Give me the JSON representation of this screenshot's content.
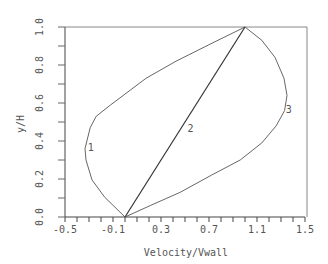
{
  "chart_data": {
    "type": "line",
    "title": "",
    "xlabel": "Velocity/Vwall",
    "ylabel": "y/H",
    "xlim": [
      -0.5,
      1.5
    ],
    "ylim": [
      0.0,
      1.0
    ],
    "x_ticks": [
      "-0.5",
      "-0.1",
      "0.3",
      "0.7",
      "1.1",
      "1.5"
    ],
    "y_ticks": [
      "0.0",
      "0.2",
      "0.4",
      "0.6",
      "0.8",
      "1.0"
    ],
    "grid": false,
    "legend": "none (curves labeled inline 1, 2, 3)",
    "series": [
      {
        "name": "1",
        "label_pos": [
          -0.31,
          0.37
        ],
        "points": [
          [
            0.0,
            0.0
          ],
          [
            -0.17,
            0.105
          ],
          [
            -0.275,
            0.195
          ],
          [
            -0.325,
            0.3
          ],
          [
            -0.333,
            0.36
          ],
          [
            -0.29,
            0.47
          ],
          [
            -0.24,
            0.53
          ],
          [
            -0.12,
            0.59
          ],
          [
            0.175,
            0.73
          ],
          [
            0.425,
            0.82
          ],
          [
            0.71,
            0.91
          ],
          [
            1.0,
            1.0
          ]
        ]
      },
      {
        "name": "2",
        "label_pos": [
          0.52,
          0.47
        ],
        "points": [
          [
            0.0,
            0.0
          ],
          [
            1.0,
            1.0
          ]
        ]
      },
      {
        "name": "3",
        "label_pos": [
          1.34,
          0.57
        ],
        "points": [
          [
            0.0,
            0.0
          ],
          [
            0.21,
            0.06
          ],
          [
            0.46,
            0.13
          ],
          [
            0.72,
            0.22
          ],
          [
            0.96,
            0.3
          ],
          [
            1.14,
            0.39
          ],
          [
            1.26,
            0.48
          ],
          [
            1.33,
            0.56
          ],
          [
            1.35,
            0.64
          ],
          [
            1.325,
            0.73
          ],
          [
            1.25,
            0.84
          ],
          [
            1.14,
            0.93
          ],
          [
            1.0,
            1.0
          ]
        ]
      }
    ]
  },
  "colors": {
    "axis": "#333333",
    "curve": "#444444",
    "text": "#555555"
  }
}
